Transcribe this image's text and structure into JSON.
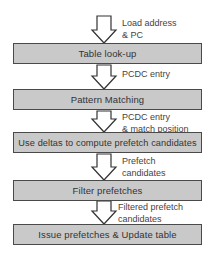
{
  "diagram": {
    "steps": [
      {
        "label": "Table look-up"
      },
      {
        "label": "Pattern Matching"
      },
      {
        "label": "Use deltas to compute prefetch candidates"
      },
      {
        "label": "Filter prefetches"
      },
      {
        "label": "Issue prefetches & Update table"
      }
    ],
    "edges": [
      {
        "line1": "Load address",
        "line2": "& PC"
      },
      {
        "line1": "PCDC entry",
        "line2": ""
      },
      {
        "line1": "PCDC entry",
        "line2": "& match position"
      },
      {
        "line1": "Prefetch",
        "line2": "candidates"
      },
      {
        "line1": "Filtered prefetch",
        "line2": "candidates"
      }
    ],
    "colors": {
      "box_fill": "#c9c9c9",
      "box_border": "#4a4a4a",
      "arrow_stroke": "#333333"
    }
  }
}
